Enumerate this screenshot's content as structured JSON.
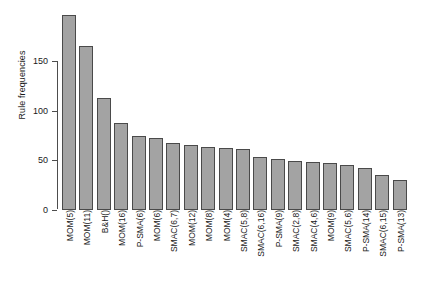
{
  "chart_data": {
    "type": "bar",
    "title": "",
    "xlabel": "",
    "ylabel": "Rule frequencies",
    "ylim": [
      0,
      200
    ],
    "yticks": [
      0,
      50,
      100,
      150
    ],
    "ytick_labels": [
      "0",
      "50",
      "100",
      "150"
    ],
    "grid": false,
    "legend": "none",
    "bar_color": "#a3a3a3",
    "bar_border_color": "#4a4a4a",
    "axis_color": "#4d4d4d",
    "categories": [
      "MOM(5)",
      "MOM(11)",
      "B&H()",
      "MOM(16)",
      "P-SMA(6)",
      "MOM(6)",
      "SMAC(6,7)",
      "MOM(12)",
      "MOM(8)",
      "MOM(4)",
      "SMAC(5,8)",
      "SMAC(6,16)",
      "P-SMA(9)",
      "SMAC(2,8)",
      "SMAC(4,6)",
      "MOM(9)",
      "SMAC(5,6)",
      "P-SMA(14)",
      "SMAC(6,15)",
      "P-SMA(13)"
    ],
    "values": [
      196,
      165,
      113,
      88,
      75,
      72,
      67,
      65,
      63,
      62,
      61,
      53,
      51,
      49,
      48,
      47,
      45,
      42,
      35,
      30
    ]
  }
}
